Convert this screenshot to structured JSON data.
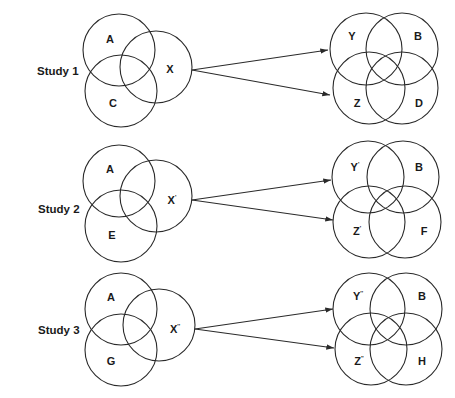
{
  "diagram": {
    "studies": [
      {
        "label": "Study 1",
        "left": {
          "A": "A",
          "X": "X",
          "C": "C",
          "X_sup": ""
        },
        "right": {
          "Y": "Y",
          "Y_sup": "",
          "B": "B",
          "Z": "Z",
          "Z_sup": "",
          "D": "D"
        }
      },
      {
        "label": "Study 2",
        "left": {
          "A": "A",
          "X": "X",
          "C": "E",
          "X_sup": "'"
        },
        "right": {
          "Y": "Y",
          "Y_sup": "'",
          "B": "B",
          "Z": "Z",
          "Z_sup": "'",
          "D": "F"
        }
      },
      {
        "label": "Study 3",
        "left": {
          "A": "A",
          "X": "X",
          "C": "G",
          "X_sup": "''"
        },
        "right": {
          "Y": "Y",
          "Y_sup": "''",
          "B": "B",
          "Z": "Z",
          "Z_sup": "''",
          "D": "H"
        }
      }
    ]
  }
}
